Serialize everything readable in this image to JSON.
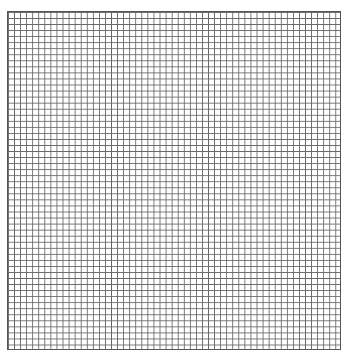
{
  "figure": {
    "type": "grid",
    "columns": 55,
    "rows": 56,
    "line_color": "#666666",
    "background_color": "#ffffff"
  }
}
